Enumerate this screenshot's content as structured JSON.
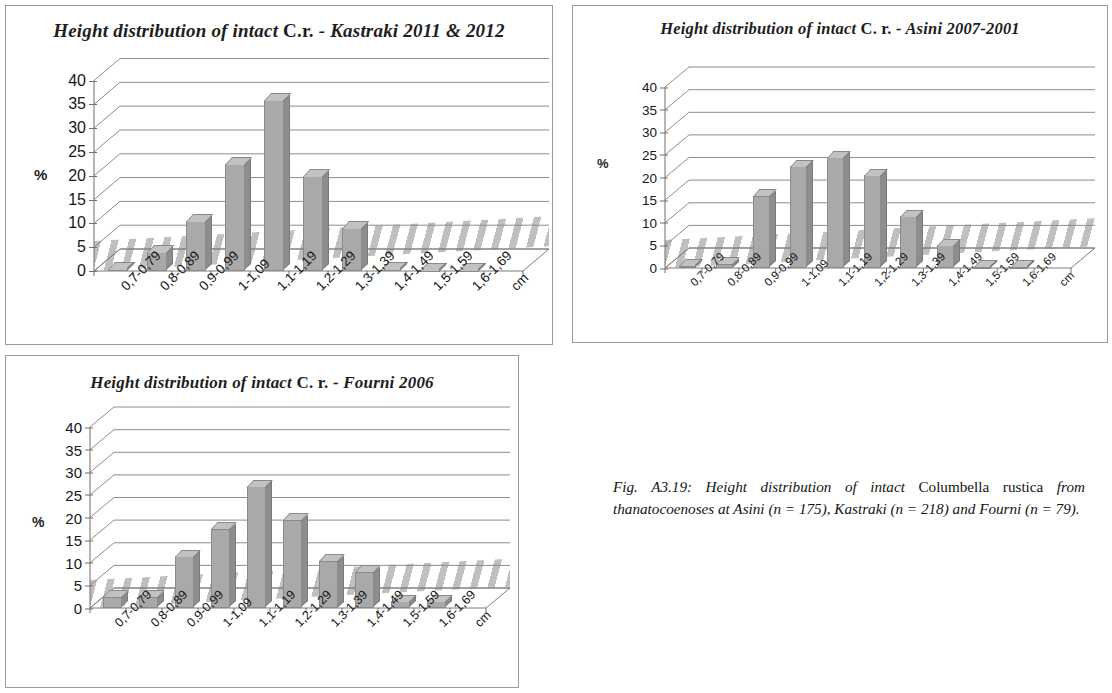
{
  "figure": {
    "caption_lead": "Fig. A3.19: Height distribution of intact ",
    "caption_species": "Columbella rustica",
    "caption_rest": " from thanatocoenoses at Asini (n = 175), Kastraki (n = 218) and Fourni (n = 79)."
  },
  "axis": {
    "ylabel": "%",
    "yticks": [
      "0",
      "5",
      "10",
      "15",
      "20",
      "25",
      "30",
      "35",
      "40"
    ],
    "xunit": "cm",
    "categories": [
      "0,7-0,79",
      "0,8-0,89",
      "0,9-0,99",
      "1-1,09",
      "1,1-1,19",
      "1,2-1,29",
      "1,3-1,39",
      "1,4-1,49",
      "1,5-1,59",
      "1,6-1,69"
    ]
  },
  "charts": [
    {
      "id": "kastraki",
      "title_italic_1": "Height distribution of intact ",
      "title_upright": "C.r.",
      "title_italic_2": " - Kastraki 2011 & 2012"
    },
    {
      "id": "asini",
      "title_italic_1": "Height distribution of intact ",
      "title_upright": "C. r.",
      "title_italic_2": " - Asini 2007-2001"
    },
    {
      "id": "fourni",
      "title_italic_1": "Height  distribution of intact ",
      "title_upright": "C. r.",
      "title_italic_2": " - Fourni 2006"
    }
  ],
  "chart_data": [
    {
      "type": "bar",
      "id": "kastraki",
      "title": "Height distribution of intact C.r. - Kastraki 2011 & 2012",
      "xlabel": "cm",
      "ylabel": "%",
      "ylim": [
        0,
        42
      ],
      "yticks": [
        0,
        5,
        10,
        15,
        20,
        25,
        30,
        35,
        40
      ],
      "grid": true,
      "legend": "none",
      "categories": [
        "0,7-0,79",
        "0,8-0,89",
        "0,9-0,99",
        "1-1,09",
        "1,1-1,19",
        "1,2-1,29",
        "1,3-1,39",
        "1,4-1,49",
        "1,5-1,59",
        "1,6-1,69"
      ],
      "values": [
        0.5,
        4.0,
        10.5,
        22.5,
        36.0,
        20.0,
        9.0,
        0.5,
        0.0,
        0.0
      ]
    },
    {
      "type": "bar",
      "id": "asini",
      "title": "Height distribution of intact C. r. - Asini 2007-2001",
      "xlabel": "cm",
      "ylabel": "%",
      "ylim": [
        0,
        42
      ],
      "yticks": [
        0,
        5,
        10,
        15,
        20,
        25,
        30,
        35,
        40
      ],
      "grid": true,
      "legend": "none",
      "categories": [
        "0,7-0,79",
        "0,8-0,89",
        "0,9-0,99",
        "1-1,09",
        "1,1-1,19",
        "1,2-1,29",
        "1,3-1,39",
        "1,4-1,49",
        "1,5-1,59",
        "1,6-1,69"
      ],
      "values": [
        0.5,
        1.0,
        16.0,
        22.5,
        24.5,
        20.5,
        11.5,
        5.0,
        0.3,
        0.3
      ]
    },
    {
      "type": "bar",
      "id": "fourni",
      "title": "Height  distribution of intact C. r. - Fourni 2006",
      "xlabel": "cm",
      "ylabel": "%",
      "ylim": [
        0,
        42
      ],
      "yticks": [
        0,
        5,
        10,
        15,
        20,
        25,
        30,
        35,
        40
      ],
      "grid": true,
      "legend": "none",
      "categories": [
        "0,7-0,79",
        "0,8-0,89",
        "0,9-0,99",
        "1-1,09",
        "1,1-1,19",
        "1,2-1,29",
        "1,3-1,39",
        "1,4-1,49",
        "1,5-1,59",
        "1,6-1,69"
      ],
      "values": [
        2.5,
        2.5,
        11.5,
        17.5,
        27.0,
        19.5,
        10.5,
        8.0,
        1.5,
        1.5
      ]
    }
  ]
}
